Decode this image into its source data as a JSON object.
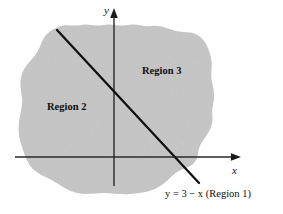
{
  "figure": {
    "kind": "math-region-diagram",
    "background_color": "#ffffff",
    "region_fill_color": "#c8c8c8",
    "line_color": "#101010",
    "axis_color": "#2a2a2a"
  },
  "axes": {
    "x_label": "x",
    "y_label": "y",
    "origin_px": [
      114,
      157
    ],
    "x_axis_from_px": [
      15,
      157
    ],
    "x_axis_to_px": [
      240,
      157
    ],
    "y_axis_from_px": [
      114,
      186
    ],
    "y_axis_to_px": [
      114,
      10
    ]
  },
  "regions": [
    {
      "id": "region-3",
      "label": "Region 3",
      "position_px": [
        142,
        66
      ]
    },
    {
      "id": "region-2",
      "label": "Region 2",
      "position_px": [
        47,
        102
      ]
    }
  ],
  "line": {
    "id": "boundary-line",
    "caption_equation": "y = 3 − x",
    "caption_region": "(Region 1)",
    "caption_full": "y = 3 − x (Region 1)",
    "caption_position_px": [
      165,
      189
    ],
    "start_px": [
      57,
      30
    ],
    "end_px": [
      199,
      183
    ]
  },
  "blob": {
    "description": "irregular shaded blob region",
    "bounds_px": {
      "left": 18,
      "top": 22,
      "right": 216,
      "bottom": 195
    }
  }
}
